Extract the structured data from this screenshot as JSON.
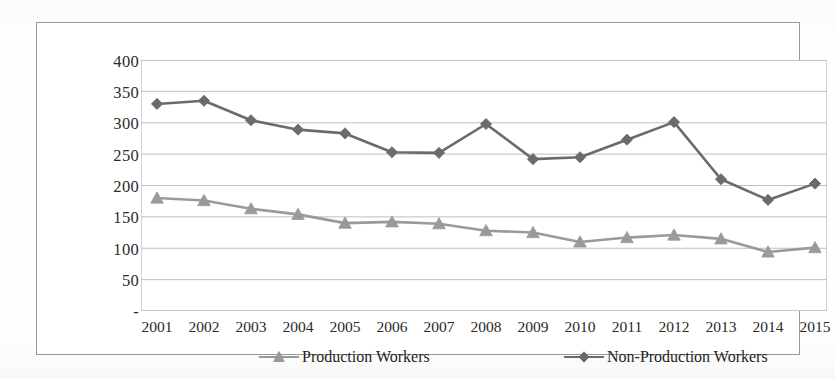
{
  "chart_data": {
    "type": "line",
    "title": "",
    "subtitle": "",
    "xlabel": "",
    "ylabel": "",
    "categories": [
      "2001",
      "2002",
      "2003",
      "2004",
      "2005",
      "2006",
      "2007",
      "2008",
      "2009",
      "2010",
      "2011",
      "2012",
      "2013",
      "2014",
      "2015"
    ],
    "ylim": [
      0,
      400
    ],
    "yticks": [
      0,
      50,
      100,
      150,
      200,
      250,
      300,
      350,
      400
    ],
    "ytick_labels": [
      "-",
      "50",
      "100",
      "150",
      "200",
      "250",
      "300",
      "350",
      "400"
    ],
    "grid": true,
    "grid_axis": "y",
    "legend_position": "bottom",
    "series": [
      {
        "name": "Production Workers",
        "marker": "triangle",
        "color": "#9a9a9a",
        "values": [
          180,
          176,
          163,
          154,
          140,
          142,
          139,
          128,
          125,
          110,
          117,
          121,
          115,
          94,
          101
        ]
      },
      {
        "name": "Non-Production Workers",
        "marker": "diamond",
        "color": "#6b6b6b",
        "values": [
          330,
          335,
          304,
          289,
          283,
          253,
          252,
          298,
          242,
          245,
          273,
          301,
          210,
          177,
          203
        ]
      }
    ]
  },
  "axis": {
    "y_tick_labels": [
      "400",
      "350",
      "300",
      "250",
      "200",
      "150",
      "100",
      "50",
      "-"
    ],
    "x_tick_labels": [
      "2001",
      "2002",
      "2003",
      "2004",
      "2005",
      "2006",
      "2007",
      "2008",
      "2009",
      "2010",
      "2011",
      "2012",
      "2013",
      "2014",
      "2015"
    ]
  },
  "legend": {
    "items": [
      {
        "label": "Production Workers",
        "icon": "triangle-marker-icon",
        "color": "#9a9a9a"
      },
      {
        "label": "Non-Production Workers",
        "icon": "diamond-marker-icon",
        "color": "#6b6b6b"
      }
    ]
  },
  "colors": {
    "production": "#9a9a9a",
    "non_production": "#6b6b6b",
    "frame": "#9a9a9a",
    "gridline": "#b9b9b9",
    "text": "#2b2b2b",
    "background": "#ffffff"
  }
}
